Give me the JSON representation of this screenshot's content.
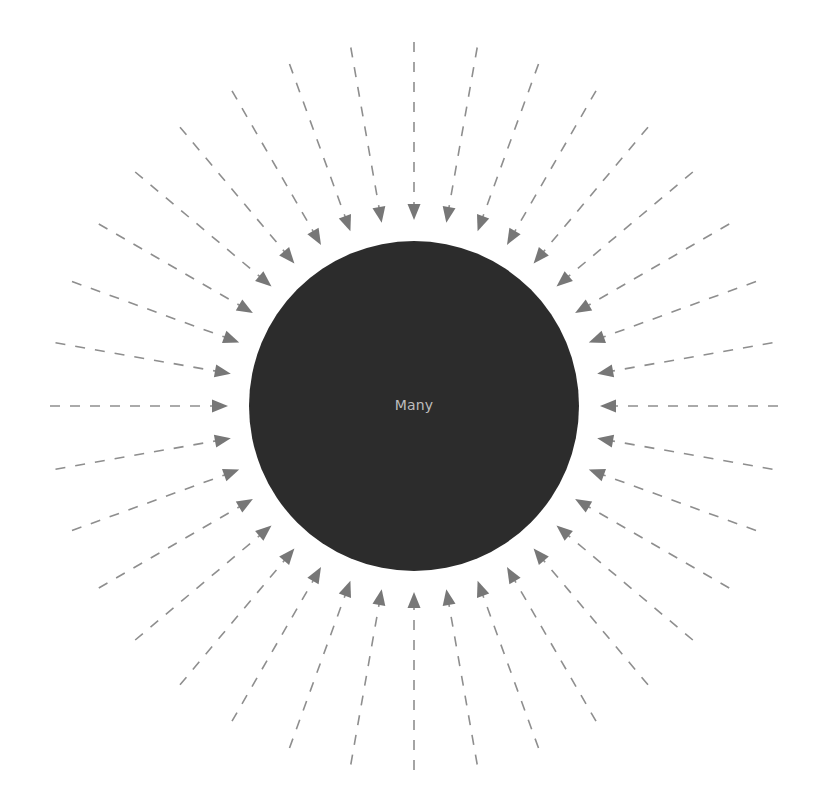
{
  "diagram": {
    "title": "",
    "center_label": "Many",
    "center": {
      "x": 414,
      "y": 406
    },
    "circle_radius": 165,
    "arrow_count": 36,
    "arrow_angle_step_deg": 10,
    "arrow_outer_radius": 364,
    "arrow_tip_radius": 186,
    "arrow_direction": "inward",
    "colors": {
      "circle_fill": "#2c2c2c",
      "arrow_shaft": "#8e8e8e",
      "arrow_head": "#777777",
      "label_text": "#bdbdbd",
      "background": "#ffffff"
    },
    "dash_pattern": [
      10,
      10
    ]
  }
}
